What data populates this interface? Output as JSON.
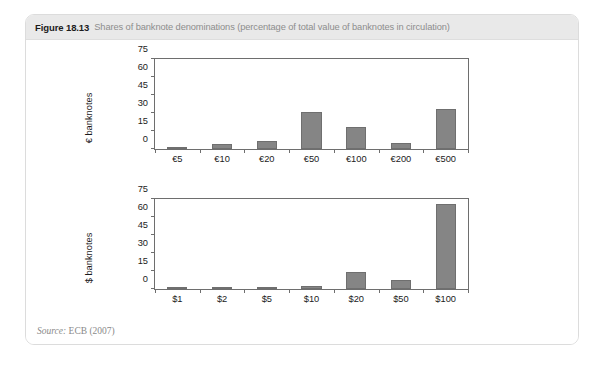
{
  "figure": {
    "number": "Figure 18.13",
    "caption": "Shares of banknote denominations (percentage of total value of banknotes in circulation)",
    "source_word": "Source:",
    "source_text": " ECB (2007)"
  },
  "colors": {
    "bar_fill": "#858585",
    "bar_stroke": "#6f6f6f",
    "axis": "#6e6e6e",
    "header_bg": "#e9e9e9",
    "caption_text": "#8d8d8d",
    "card_border": "#dcdcdc",
    "source_text": "#8a8a8a"
  },
  "chart_data": [
    {
      "id": "euro",
      "type": "bar",
      "title": "Figure 18.13 Shares of banknote denominations (percentage of total value of banknotes in circulation)",
      "xlabel": "",
      "ylabel": "€ banknotes",
      "categories": [
        "€5",
        "€10",
        "€20",
        "€50",
        "€100",
        "€200",
        "€500"
      ],
      "values": [
        1,
        4,
        7,
        31,
        18,
        5,
        33
      ],
      "ylim": [
        0,
        75
      ],
      "yticks": [
        0,
        15,
        30,
        45,
        60,
        75
      ],
      "grid": false,
      "legend": "none"
    },
    {
      "id": "dollar",
      "type": "bar",
      "title": "",
      "xlabel": "",
      "ylabel": "$ banknotes",
      "categories": [
        "$1",
        "$2",
        "$5",
        "$10",
        "$20",
        "$50",
        "$100"
      ],
      "values": [
        1,
        0.3,
        1,
        2.5,
        14.5,
        7.5,
        71
      ],
      "ylim": [
        0,
        75
      ],
      "yticks": [
        0,
        15,
        30,
        45,
        60,
        75
      ],
      "grid": false,
      "legend": "none"
    }
  ]
}
